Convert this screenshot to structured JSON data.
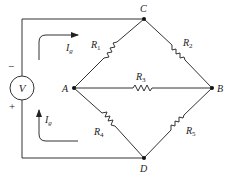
{
  "diagram": {
    "type": "Wheatstone bridge circuit",
    "nodes": {
      "A": {
        "label": "A"
      },
      "B": {
        "label": "B"
      },
      "C": {
        "label": "C"
      },
      "D": {
        "label": "D"
      }
    },
    "resistors": [
      {
        "label": "R",
        "sub": "1",
        "from": "A",
        "to": "C"
      },
      {
        "label": "R",
        "sub": "2",
        "from": "C",
        "to": "B"
      },
      {
        "label": "R",
        "sub": "3",
        "from": "A",
        "to": "B"
      },
      {
        "label": "R",
        "sub": "4",
        "from": "A",
        "to": "D"
      },
      {
        "label": "R",
        "sub": "5",
        "from": "D",
        "to": "B"
      }
    ],
    "source": {
      "label": "V",
      "minus": "−",
      "plus": "+"
    },
    "currents": [
      {
        "label": "I",
        "sub": "g",
        "direction": "right",
        "position": "top"
      },
      {
        "label": "I",
        "sub": "g",
        "direction": "up",
        "position": "bottom"
      }
    ]
  }
}
